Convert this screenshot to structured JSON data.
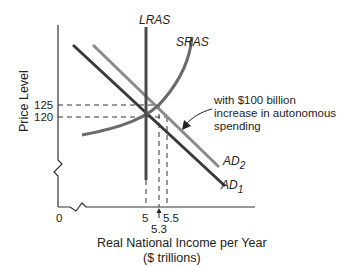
{
  "diagram": {
    "title": "",
    "y_axis": {
      "label": "Price Level",
      "ticks": [
        "125",
        "120"
      ]
    },
    "x_axis": {
      "label_line1": "Real National Income per Year",
      "label_line2": "($ trillions)",
      "origin": "0",
      "ticks": [
        "5",
        "5.5"
      ],
      "tick_below": "5.3"
    },
    "curves": {
      "lras": "LRAS",
      "sras": "SRAS",
      "ad1_base": "AD",
      "ad1_sub": "1",
      "ad2_base": "AD",
      "ad2_sub": "2"
    },
    "annotation": {
      "line1": "with $100 billion",
      "line2": "increase in autonomous",
      "line3": "spending"
    },
    "colors": {
      "dark_line": "#3a3a3a",
      "light_line": "#8a8a8a",
      "axis": "#333333"
    }
  }
}
